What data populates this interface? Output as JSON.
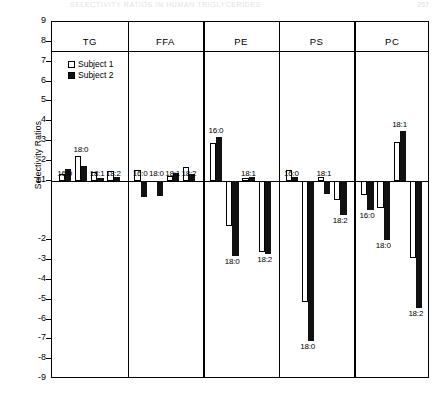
{
  "page": {
    "running_head": "SELECTIVITY RATIOS IN HUMAN TRIGLYCERIDES",
    "page_number": "267"
  },
  "legend": {
    "items": [
      {
        "label": "Subject 1",
        "style": "open",
        "color": "#ffffff"
      },
      {
        "label": "Subject 2",
        "style": "filled",
        "color": "#111111"
      }
    ]
  },
  "chart_data": {
    "type": "bar",
    "title": "",
    "xlabel": "",
    "ylabel": "Selectivity Ratios",
    "ylim": [
      -9,
      9
    ],
    "grid": false,
    "legend_position": "top-left-inside",
    "yticks": [
      "9",
      "8",
      "7",
      "6",
      "5",
      "4",
      "3",
      "2",
      "±1",
      "-2",
      "-3",
      "-4",
      "-5",
      "-6",
      "-7",
      "-8",
      "-9"
    ],
    "ytick_values": [
      9,
      8,
      7,
      6,
      5,
      4,
      3,
      2,
      1,
      -2,
      -3,
      -4,
      -5,
      -6,
      -7,
      -8,
      -9
    ],
    "baseline_value": 1,
    "note": "Baseline drawn at the ±1 tick; bars are measured from that line.",
    "panels": [
      {
        "name": "TG",
        "categories": [
          "16:0",
          "18:0",
          "18:1",
          "18:2"
        ],
        "series": [
          {
            "name": "Subject 1",
            "values": [
              0.35,
              1.25,
              0.45,
              0.5
            ]
          },
          {
            "name": "Subject 2",
            "values": [
              0.6,
              0.75,
              0.15,
              0.2
            ]
          }
        ]
      },
      {
        "name": "FFA",
        "categories": [
          "16:0",
          "18:0",
          "18:1",
          "18:2"
        ],
        "series": [
          {
            "name": "Subject 1",
            "values": [
              0.55,
              0.0,
              0.25,
              0.7
            ]
          },
          {
            "name": "Subject 2",
            "values": [
              -0.8,
              -0.75,
              0.4,
              0.35
            ]
          }
        ]
      },
      {
        "name": "PE",
        "categories": [
          "16:0",
          "18:0",
          "18:1",
          "18:2"
        ],
        "series": [
          {
            "name": "Subject 1",
            "values": [
              1.9,
              -2.3,
              0.15,
              -3.6
            ]
          },
          {
            "name": "Subject 2",
            "values": [
              2.2,
              -3.8,
              0.2,
              -3.7
            ]
          }
        ]
      },
      {
        "name": "PS",
        "categories": [
          "16:0",
          "18:0",
          "18:1",
          "18:2"
        ],
        "series": [
          {
            "name": "Subject 1",
            "values": [
              0.55,
              -6.1,
              0.2,
              -1.0
            ]
          },
          {
            "name": "Subject 2",
            "values": [
              0.2,
              -8.1,
              -0.65,
              -1.75
            ]
          }
        ]
      },
      {
        "name": "PC",
        "categories": [
          "16:0",
          "18:0",
          "18:1",
          "18:2"
        ],
        "series": [
          {
            "name": "Subject 1",
            "values": [
              -0.7,
              -1.4,
              1.95,
              -3.9
            ]
          },
          {
            "name": "Subject 2",
            "values": [
              -1.5,
              -3.0,
              2.5,
              -6.4
            ]
          }
        ]
      }
    ]
  }
}
